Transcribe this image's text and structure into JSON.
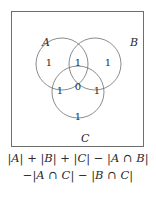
{
  "figure": {
    "type": "venn-diagram",
    "background_color": "#ffffff",
    "stroke_color": "#6e6e6e",
    "text_color": "#2b2b2b"
  },
  "box": {
    "border_color": "#6e6e6e"
  },
  "sets": [
    {
      "key": "A",
      "label": "A",
      "label_x": 30,
      "label_y": 25
    },
    {
      "key": "B",
      "label": "B",
      "label_x": 118,
      "label_y": 25
    },
    {
      "key": "C",
      "label": "C",
      "label_x": 69,
      "label_y": 121
    }
  ],
  "regions": [
    {
      "key": "A-only",
      "label": "A only",
      "count": "1",
      "x": 37,
      "y": 46
    },
    {
      "key": "AB",
      "label": "A and B",
      "count": "1",
      "x": 66,
      "y": 46
    },
    {
      "key": "B-only",
      "label": "B only",
      "count": "1",
      "x": 96,
      "y": 46
    },
    {
      "key": "AC",
      "label": "A and C",
      "count": "1",
      "x": 48,
      "y": 74
    },
    {
      "key": "ABC",
      "label": "A and B and C",
      "count": "0",
      "x": 66,
      "y": 70
    },
    {
      "key": "BC",
      "label": "B and C",
      "count": "1",
      "x": 85,
      "y": 74
    },
    {
      "key": "C-only",
      "label": "C only",
      "count": "1",
      "x": 66,
      "y": 100
    }
  ],
  "formula": {
    "line1": "|A| + |B| + |C| − |A ∩ B|",
    "line2": "−|A ∩ C| − |B ∩ C|",
    "full": "|A| + |B| + |C| − |A ∩ B| − |A ∩ C| − |B ∩ C|"
  }
}
